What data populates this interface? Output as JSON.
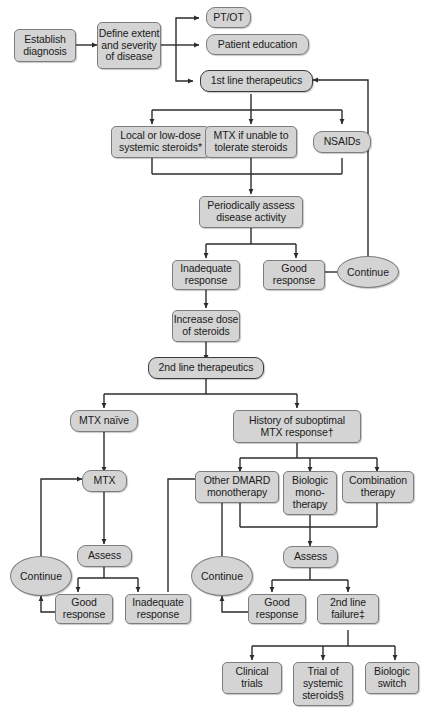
{
  "diagram": {
    "type": "flowchart",
    "colors": {
      "node_fill": "#d4d4d4",
      "node_border": "#7d7d7d",
      "emphasis_border": "#3a3a3a",
      "edge": "#2b2b2b",
      "background": "#ffffff",
      "text": "#1a1a1a"
    },
    "nodes": {
      "establish_diagnosis": "Establish diagnosis",
      "define_extent": "Define extent and severity of disease",
      "pt_ot": "PT/OT",
      "patient_education": "Patient education",
      "first_line": "1st line therapeutics",
      "local_steroids": "Local or low-dose systemic steroids*",
      "mtx_unable": "MTX if unable to tolerate steroids",
      "nsaids": "NSAIDs",
      "periodically_assess": "Periodically assess disease activity",
      "inadequate_response_1": "Inadequate response",
      "good_response_1": "Good response",
      "continue_1": "Continue",
      "increase_dose": "Increase dose of steroids",
      "second_line": "2nd line therapeutics",
      "mtx_naive": "MTX naïve",
      "history_suboptimal": "History of suboptimal MTX response†",
      "mtx": "MTX",
      "other_dmard": "Other DMARD monotherapy",
      "biologic_mono": "Biologic mono-therapy",
      "combination": "Combination therapy",
      "assess_left": "Assess",
      "assess_right": "Assess",
      "continue_left": "Continue",
      "continue_right": "Continue",
      "good_response_left": "Good response",
      "inadequate_response_left": "Inadequate response",
      "good_response_right": "Good response",
      "second_line_failure": "2nd line failure‡",
      "clinical_trials": "Clinical trials",
      "trial_systemic": "Trial of systemic steroids§",
      "biologic_switch": "Biologic switch"
    },
    "node_lines": {
      "establish_diagnosis": [
        "Establish",
        "diagnosis"
      ],
      "define_extent": [
        "Define extent",
        "and severity",
        "of disease"
      ],
      "pt_ot": [
        "PT/OT"
      ],
      "patient_education": [
        "Patient education"
      ],
      "first_line": [
        "1st line therapeutics"
      ],
      "local_steroids": [
        "Local or low-dose",
        "systemic steroids*"
      ],
      "mtx_unable": [
        "MTX if unable to",
        "tolerate steroids"
      ],
      "nsaids": [
        "NSAIDs"
      ],
      "periodically_assess": [
        "Periodically assess",
        "disease activity"
      ],
      "inadequate_response_1": [
        "Inadequate",
        "response"
      ],
      "good_response_1": [
        "Good",
        "response"
      ],
      "continue_1": [
        "Continue"
      ],
      "increase_dose": [
        "Increase dose",
        "of steroids"
      ],
      "second_line": [
        "2nd line therapeutics"
      ],
      "mtx_naive": [
        "MTX naïve"
      ],
      "history_suboptimal": [
        "History of suboptimal",
        "MTX response†"
      ],
      "mtx": [
        "MTX"
      ],
      "other_dmard": [
        "Other DMARD",
        "monotherapy"
      ],
      "biologic_mono": [
        "Biologic",
        "mono-",
        "therapy"
      ],
      "combination": [
        "Combination",
        "therapy"
      ],
      "assess_left": [
        "Assess"
      ],
      "assess_right": [
        "Assess"
      ],
      "continue_left": [
        "Continue"
      ],
      "continue_right": [
        "Continue"
      ],
      "good_response_left": [
        "Good",
        "response"
      ],
      "inadequate_response_left": [
        "Inadequate",
        "response"
      ],
      "good_response_right": [
        "Good",
        "response"
      ],
      "second_line_failure": [
        "2nd line",
        "failure‡"
      ],
      "clinical_trials": [
        "Clinical",
        "trials"
      ],
      "trial_systemic": [
        "Trial of",
        "systemic",
        "steroids§"
      ],
      "biologic_switch": [
        "Biologic",
        "switch"
      ]
    },
    "footnote_markers": [
      "*",
      "†",
      "‡",
      "§"
    ]
  }
}
